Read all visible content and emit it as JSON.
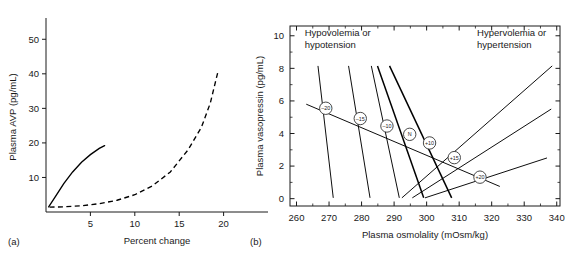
{
  "figure": {
    "panels": [
      {
        "caption": "(a)",
        "xlabel": "Percent change",
        "ylabel": "Plasma AVP (pg/mL)"
      },
      {
        "caption": "(b)",
        "xlabel": "Plasma osmolality (mOsm/kg)",
        "ylabel": "Plasma vasopressin (pg/mL)"
      }
    ]
  },
  "chart_data": [
    {
      "type": "line",
      "panel": "(a)",
      "title": "",
      "xlabel": "Percent change",
      "ylabel": "Plasma AVP (pg/mL)",
      "xlim": [
        0,
        25
      ],
      "ylim": [
        0,
        55
      ],
      "xticks": [
        5,
        10,
        15,
        20
      ],
      "yticks": [
        10,
        20,
        30,
        40,
        50
      ],
      "grid": false,
      "legend": "none",
      "series": [
        {
          "name": "volume-response-solid",
          "style": "solid",
          "x": [
            0.3,
            1.0,
            2.0,
            3.0,
            4.0,
            5.0,
            6.0,
            6.6
          ],
          "y": [
            1.5,
            4.2,
            8.2,
            11.6,
            14.4,
            16.6,
            18.4,
            19.2
          ]
        },
        {
          "name": "osmolality-response-dashed",
          "style": "dashed",
          "x": [
            0.4,
            2.0,
            4.0,
            6.0,
            8.0,
            10.0,
            12.0,
            14.0,
            16.0,
            17.5,
            18.5,
            19.4
          ],
          "y": [
            1.4,
            1.5,
            1.8,
            2.4,
            3.4,
            5.0,
            7.6,
            11.6,
            18.0,
            24.5,
            31.5,
            41.0
          ]
        }
      ]
    },
    {
      "type": "line",
      "panel": "(b)",
      "title": "",
      "xlabel": "Plasma osmolality (mOsm/kg)",
      "ylabel": "Plasma vasopressin (pg/mL)",
      "xlim": [
        258,
        341
      ],
      "ylim": [
        -0.45,
        10.6
      ],
      "xticks": [
        260,
        270,
        280,
        290,
        300,
        310,
        320,
        330,
        340
      ],
      "yticks": [
        0,
        2,
        4,
        6,
        8,
        10
      ],
      "xticks_minor": [
        265,
        275,
        285,
        295,
        305,
        315,
        325,
        335
      ],
      "yticks_minor": [
        1,
        3,
        5,
        7,
        9
      ],
      "grid": false,
      "legend": "none",
      "annotations": [
        {
          "name": "left-annotation",
          "text": [
            "Hypovolemia or",
            "hypotension"
          ],
          "x": 262.5,
          "y": 10.0
        },
        {
          "name": "right-annotation",
          "text": [
            "Hypervolemia or",
            "hypertension"
          ],
          "x": 315.5,
          "y": 10.0
        }
      ],
      "pivot_axis": {
        "name": "isopleth-pivot-line",
        "x": [
          263.0,
          322.5
        ],
        "y": [
          5.8,
          0.75
        ]
      },
      "series": [
        {
          "name": "blood-volume-change-minus-20",
          "label": "–20",
          "node": {
            "x": 269.0,
            "y": 5.55
          },
          "x": [
            266.6,
            271.3
          ],
          "y": [
            8.15,
            0.05
          ]
        },
        {
          "name": "blood-volume-change-minus-15",
          "label": "–15",
          "node": {
            "x": 279.6,
            "y": 4.92
          },
          "x": [
            276.0,
            282.6
          ],
          "y": [
            8.15,
            0.05
          ]
        },
        {
          "name": "blood-volume-change-minus-10",
          "label": "–10",
          "node": {
            "x": 287.8,
            "y": 4.46
          },
          "x": [
            283.0,
            291.6
          ],
          "y": [
            8.15,
            0.05
          ]
        },
        {
          "name": "blood-volume-change-normal",
          "label": "N",
          "node": {
            "x": 294.8,
            "y": 3.95
          },
          "x": [
            284.9,
            299.1
          ],
          "y": [
            8.15,
            0.05
          ]
        },
        {
          "name": "blood-volume-change-plus-10",
          "label": "+10",
          "node": {
            "x": 300.9,
            "y": 3.42
          },
          "x": [
            288.6,
            307.7
          ],
          "y": [
            8.15,
            0.05
          ]
        },
        {
          "name": "blood-volume-change-plus-15",
          "label": "+15",
          "node": {
            "x": 308.5,
            "y": 2.52
          },
          "x": [
            292.4,
            338.6
          ],
          "y": [
            0.05,
            8.15
          ]
        },
        {
          "name": "blood-volume-change-plus-20",
          "label": "+20",
          "node": {
            "x": 316.4,
            "y": 1.32
          },
          "x": [
            295.6,
            338.3
          ],
          "y": [
            0.05,
            5.5
          ]
        },
        {
          "name": "blood-volume-change-plus-20-extra",
          "label": "",
          "node": null,
          "x": [
            299.5,
            337.0
          ],
          "y": [
            0.05,
            2.5
          ]
        }
      ]
    }
  ]
}
